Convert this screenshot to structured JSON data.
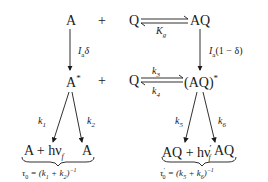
{
  "diagram": {
    "type": "photophysical reaction scheme",
    "row1": {
      "a": "A",
      "plus": "+",
      "q": "Q",
      "aq": "AQ",
      "eq_label": "K",
      "eq_sub": "g"
    },
    "vertical_left": {
      "label": "I",
      "label_sub": "a",
      "label_tail": "δ"
    },
    "vertical_right": {
      "label": "I",
      "label_sub": "a",
      "label_tail": "(1 − δ)"
    },
    "row2": {
      "a_star": "A",
      "star": "*",
      "plus": "+",
      "q": "Q",
      "aq_star": "(AQ)",
      "star2": "*",
      "k_forward": "k",
      "k_forward_sub": "3",
      "k_back": "k",
      "k_back_sub": "4"
    },
    "left_branch": {
      "k1": "k",
      "k1_sub": "1",
      "k2": "k",
      "k2_sub": "2",
      "product1": "A + hν",
      "product1_sub": "f",
      "product2": "A",
      "tau": "τ",
      "tau_sub": "0",
      "tau_expr": " = (k",
      "tau_k1_sub": "1",
      "tau_plus": " + k",
      "tau_k2_sub": "2",
      "tau_close": ")",
      "tau_exp": "−1"
    },
    "right_branch": {
      "k5": "k",
      "k5_sub": "5",
      "k6": "k",
      "k6_sub": "6",
      "product1": "AQ + hν",
      "product1_prime": "′",
      "product1_sub": "f",
      "product2": "AQ",
      "tau": "τ",
      "tau_prime": "′",
      "tau_sub": "0",
      "tau_expr": " = (k",
      "tau_k5_sub": "5",
      "tau_plus": " + k",
      "tau_k6_sub": "6",
      "tau_close": ")",
      "tau_exp": "−1"
    }
  }
}
